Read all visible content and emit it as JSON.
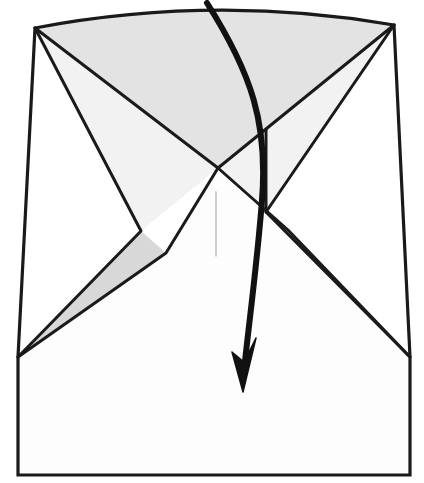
{
  "figure": {
    "kind": "origami-fold-diagram",
    "title": "Origami folding step diagram",
    "canvas": {
      "width": 424,
      "height": 483
    },
    "colors": {
      "background": "#ffffff",
      "paper_front": "#fdfdfd",
      "paper_shade_light": "#eeeeee",
      "paper_shade_mid": "#e3e3e3",
      "paper_shade_dark": "#d8d8d8",
      "outline": "#1a1a1a",
      "crease_faint": "#b9b9b9",
      "arrow": "#111111"
    },
    "stroke_widths": {
      "outline": 3.2,
      "crease": 3.0,
      "faint_crease": 1.4,
      "arrow": 6.0
    }
  },
  "geometry": {
    "points": {
      "top_left": [
        35,
        28
      ],
      "top_apex": [
        215,
        5
      ],
      "top_right": [
        394,
        25
      ],
      "center_x": [
        218,
        168
      ],
      "right_node": [
        266,
        130
      ],
      "left_sliver_inner": [
        141,
        231
      ],
      "left_sliver_lower": [
        166,
        253
      ],
      "right_sliver_inner": [
        288,
        230
      ],
      "right_sliver_upper": [
        266,
        212
      ],
      "left_wing_tip": [
        18,
        357
      ],
      "right_wing_tip": [
        410,
        357
      ],
      "bottom_left": [
        18,
        475
      ],
      "bottom_right": [
        410,
        475
      ],
      "faint_crease_top": [
        216,
        192
      ],
      "faint_crease_bottom": [
        216,
        256
      ]
    },
    "paths": {
      "outer_body": "M35,28 Q215,-6 394,25 L410,357 L410,475 L18,475 L18,357 Z",
      "upper_shade_region": "M35,28 Q215,-6 394,25 L266,130 L218,168 Z",
      "left_upper_flap": "M35,28 L218,168 L141,231 Z",
      "right_upper_flap": "M394,25 L266,212 L218,168 L266,130 Z",
      "left_sliver": "M141,231 L166,253 L18,357 Z",
      "right_sliver": "M288,230 L266,212 L410,357 Z",
      "lower_body": "M218,168 L288,230 L410,357 L410,475 L18,475 L18,357 L166,253 Z",
      "crease_left_long": "M35,28 L218,168",
      "crease_left_to_tip": "M35,28 L141,231 L18,357",
      "crease_right_long": "M394,25 L218,168",
      "crease_right_to_tip": "M394,25 L266,212 L410,357",
      "crease_center_left": "M218,168 L166,253 L18,357",
      "crease_center_right": "M218,168 L288,230 L410,357",
      "crease_right_node": "M266,130 L266,212",
      "faint_center_crease": "M216,192 L216,256",
      "arrow_curve": "M207,3 C252,74 268,124 262,200 C257,266 248,330 243,380"
    },
    "arrow": {
      "start": [
        207,
        3
      ],
      "tip": [
        243,
        392
      ],
      "head_shape": "M243,392 L232,352 L244,362 L256,338 Z",
      "direction": "downward-sweep"
    }
  }
}
